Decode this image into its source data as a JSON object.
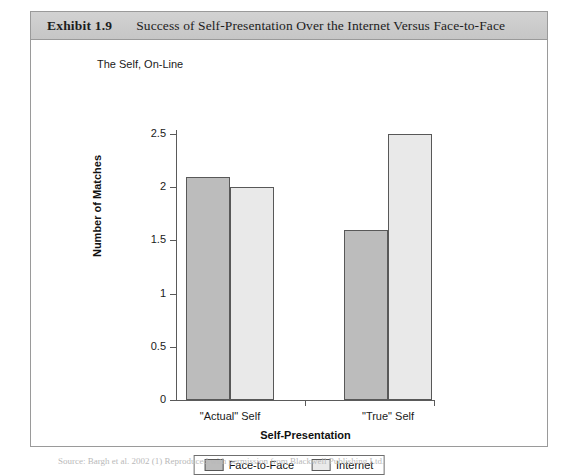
{
  "exhibit": {
    "number": "Exhibit 1.9",
    "title": "Success of Self-Presentation Over the Internet Versus Face-to-Face"
  },
  "source_note": "Source: Bargh et al. 2002 (1) Reproduced with permission from Blackwell Publishing Ltd.",
  "chart_data": {
    "type": "bar",
    "title": "The Self, On-Line",
    "xlabel": "Self-Presentation",
    "ylabel": "Number of Matches",
    "categories": [
      "\"Actual\" Self",
      "\"True\" Self"
    ],
    "series": [
      {
        "name": "Face-to-Face",
        "values": [
          2.1,
          1.6
        ],
        "color": "#bcbcbc"
      },
      {
        "name": "Internet",
        "values": [
          2.0,
          2.5
        ],
        "color": "#e9e9e9"
      }
    ],
    "ylim": [
      0,
      2.5
    ],
    "yticks": [
      0,
      0.5,
      1,
      1.5,
      2,
      2.5
    ],
    "ytick_labels": [
      "0",
      "0.5",
      "1",
      "1.5",
      "2",
      "2.5"
    ],
    "grid": false,
    "legend_position": "bottom"
  }
}
